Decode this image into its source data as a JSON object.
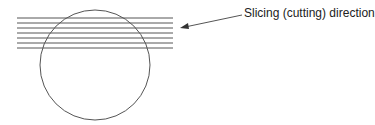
{
  "diagram": {
    "label": "Slicing (cutting) direction",
    "stroke_color": "#555555",
    "circle": {
      "cx": 95,
      "cy": 65,
      "r": 55
    },
    "slice_lines": {
      "count": 7,
      "x1": 17,
      "x2": 173,
      "y_start": 18,
      "spacing": 5
    },
    "arrow": {
      "from": [
        242,
        15
      ],
      "to": [
        181,
        28
      ]
    }
  }
}
